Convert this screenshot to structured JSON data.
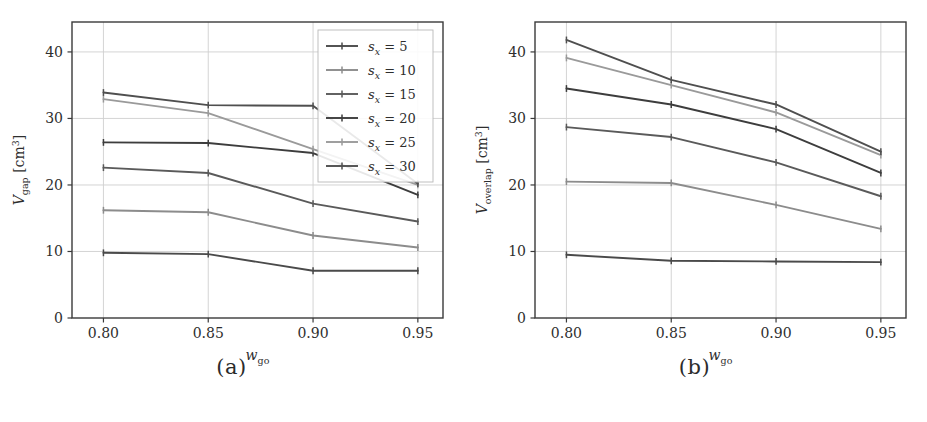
{
  "figure": {
    "panels": [
      {
        "caption": "(a)",
        "ylabel_main": "V",
        "ylabel_sub": "gap",
        "ylabel_unit": "[cm",
        "ylabel_unit_sup": "3",
        "ylabel_unit_end": "]",
        "xlabel_main": "w",
        "xlabel_sub": "go"
      },
      {
        "caption": "(b)",
        "ylabel_main": "V",
        "ylabel_sub": "overlap",
        "ylabel_unit": "[cm",
        "ylabel_unit_sup": "3",
        "ylabel_unit_end": "]",
        "xlabel_main": "w",
        "xlabel_sub": "go"
      }
    ],
    "legend": {
      "entries": [
        {
          "symbol": "s",
          "sub": "x",
          "eq": "= 5",
          "value": 5
        },
        {
          "symbol": "s",
          "sub": "x",
          "eq": "= 10",
          "value": 10
        },
        {
          "symbol": "s",
          "sub": "x",
          "eq": "= 15",
          "value": 15
        },
        {
          "symbol": "s",
          "sub": "x",
          "eq": "= 20",
          "value": 20
        },
        {
          "symbol": "s",
          "sub": "x",
          "eq": "= 25",
          "value": 25
        },
        {
          "symbol": "s",
          "sub": "x",
          "eq": "= 30",
          "value": 30
        }
      ]
    }
  },
  "chart_data": [
    {
      "type": "line",
      "panel": "a",
      "title": "",
      "xlabel": "w_go",
      "ylabel": "V_gap [cm^3]",
      "x": [
        0.8,
        0.85,
        0.9,
        0.95
      ],
      "xticks": [
        "0.80",
        "0.85",
        "0.90",
        "0.95"
      ],
      "yticks": [
        0,
        10,
        20,
        30,
        40
      ],
      "ytick_labels": [
        "0",
        "10",
        "20",
        "30",
        "40"
      ],
      "xlim": [
        0.785,
        0.962
      ],
      "ylim": [
        0,
        44.5
      ],
      "grid": true,
      "legend_position": "upper right",
      "series": [
        {
          "name": "s_x = 5",
          "values": [
            9.8,
            9.6,
            7.1,
            7.1
          ],
          "color": "#4a4a4a"
        },
        {
          "name": "s_x = 10",
          "values": [
            16.2,
            15.9,
            12.4,
            10.6
          ],
          "color": "#8c8c8c"
        },
        {
          "name": "s_x = 15",
          "values": [
            22.6,
            21.8,
            17.2,
            14.5
          ],
          "color": "#5a5a5a"
        },
        {
          "name": "s_x = 20",
          "values": [
            26.4,
            26.3,
            24.8,
            18.5
          ],
          "color": "#3d3d3d"
        },
        {
          "name": "s_x = 25",
          "values": [
            32.9,
            30.8,
            25.4,
            20.0
          ],
          "color": "#9a9a9a"
        },
        {
          "name": "s_x = 30",
          "values": [
            33.9,
            32.0,
            31.9,
            20.2
          ],
          "color": "#4f4f4f"
        }
      ]
    },
    {
      "type": "line",
      "panel": "b",
      "title": "",
      "xlabel": "w_go",
      "ylabel": "V_overlap [cm^3]",
      "x": [
        0.8,
        0.85,
        0.9,
        0.95
      ],
      "xticks": [
        "0.80",
        "0.85",
        "0.90",
        "0.95"
      ],
      "yticks": [
        0,
        10,
        20,
        30,
        40
      ],
      "ytick_labels": [
        "0",
        "10",
        "20",
        "30",
        "40"
      ],
      "xlim": [
        0.785,
        0.962
      ],
      "ylim": [
        0,
        44.5
      ],
      "grid": true,
      "legend_position": "none",
      "series": [
        {
          "name": "s_x = 5",
          "values": [
            9.5,
            8.6,
            8.5,
            8.4
          ],
          "color": "#4a4a4a"
        },
        {
          "name": "s_x = 10",
          "values": [
            20.5,
            20.3,
            17.0,
            13.4
          ],
          "color": "#8c8c8c"
        },
        {
          "name": "s_x = 15",
          "values": [
            28.7,
            27.2,
            23.4,
            18.3
          ],
          "color": "#5a5a5a"
        },
        {
          "name": "s_x = 20",
          "values": [
            34.5,
            32.1,
            28.4,
            21.8
          ],
          "color": "#3d3d3d"
        },
        {
          "name": "s_x = 25",
          "values": [
            39.1,
            35.0,
            30.9,
            24.5
          ],
          "color": "#9a9a9a"
        },
        {
          "name": "s_x = 30",
          "values": [
            41.8,
            35.8,
            32.1,
            25.0
          ],
          "color": "#4f4f4f"
        }
      ]
    }
  ],
  "style": {
    "axis_color": "#3a3a3a",
    "grid_color": "#cfcfcf",
    "background": "#ffffff",
    "text_color": "#2e2e2e"
  }
}
